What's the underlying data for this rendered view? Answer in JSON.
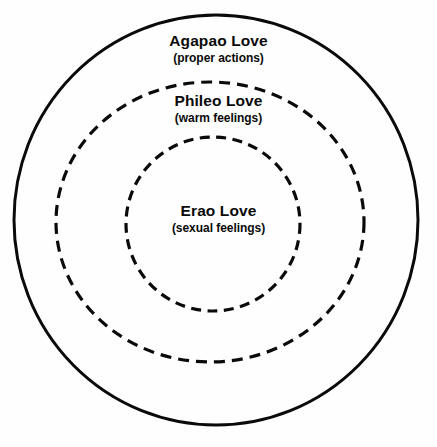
{
  "diagram": {
    "type": "concentric-circles",
    "background_color": "#fefefe",
    "stroke_color": "#0a0a0a",
    "rings": [
      {
        "id": "outer",
        "name": "agapao",
        "title": "Agapao Love",
        "subtitle": "(proper actions)",
        "line_style": "solid",
        "stroke_width": 3,
        "center_x": 216,
        "center_y": 220,
        "radius_x": 202,
        "radius_y": 205
      },
      {
        "id": "middle",
        "name": "phileo",
        "title": "Phileo Love",
        "subtitle": "(warm feelings)",
        "line_style": "dashed",
        "stroke_width": 3,
        "center_x": 210,
        "center_y": 222,
        "radius_x": 154,
        "radius_y": 140
      },
      {
        "id": "inner",
        "name": "erao",
        "title": "Erao Love",
        "subtitle": "(sexual feelings)",
        "line_style": "dashed",
        "stroke_width": 3,
        "center_x": 213,
        "center_y": 224,
        "radius_x": 87,
        "radius_y": 87
      }
    ],
    "labels": {
      "agapao": {
        "title": "Agapao Love",
        "subtitle": "(proper actions)"
      },
      "phileo": {
        "title": "Phileo Love",
        "subtitle": "(warm feelings)"
      },
      "erao": {
        "title": "Erao Love",
        "subtitle": "(sexual feelings)"
      }
    }
  }
}
